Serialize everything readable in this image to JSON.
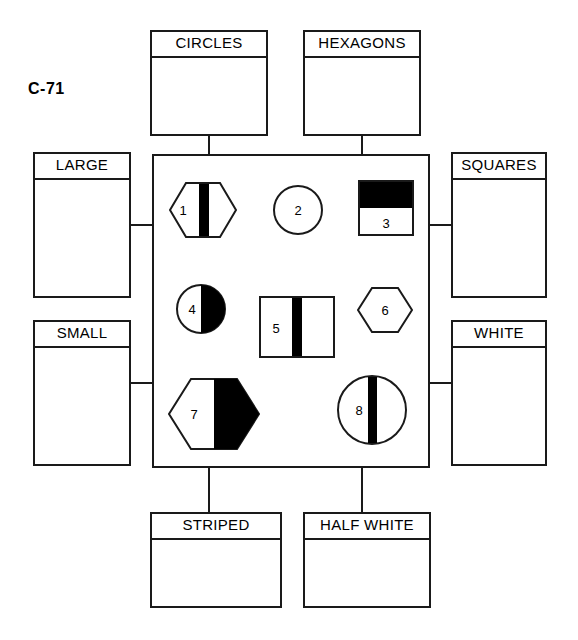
{
  "figure": {
    "title": "C-71",
    "type": "attribute-block classification grid"
  },
  "labels": {
    "top_left": "CIRCLES",
    "top_right": "HEXAGONS",
    "left_upper": "LARGE",
    "left_lower": "SMALL",
    "right_upper": "SQUARES",
    "right_lower": "WHITE",
    "bottom_left": "STRIPED",
    "bottom_right": "HALF WHITE"
  },
  "shapes": [
    {
      "number": "1",
      "form": "hexagon",
      "size": "large",
      "fill": "striped",
      "description": "large striped hexagon"
    },
    {
      "number": "2",
      "form": "circle",
      "size": "small",
      "fill": "white",
      "description": "small white circle"
    },
    {
      "number": "3",
      "form": "square",
      "size": "small",
      "fill": "half white",
      "description": "small half white square"
    },
    {
      "number": "4",
      "form": "circle",
      "size": "small",
      "fill": "half white",
      "description": "small half white circle"
    },
    {
      "number": "5",
      "form": "square",
      "size": "large",
      "fill": "striped",
      "description": "large striped square"
    },
    {
      "number": "6",
      "form": "hexagon",
      "size": "small",
      "fill": "white",
      "description": "small white hexagon"
    },
    {
      "number": "7",
      "form": "hexagon",
      "size": "large",
      "fill": "half white",
      "description": "large half white hexagon"
    },
    {
      "number": "8",
      "form": "circle",
      "size": "large",
      "fill": "striped",
      "description": "large striped circle"
    }
  ],
  "colors": {
    "line": "#1a1a1a",
    "fill_black": "#000000",
    "background": "#ffffff"
  }
}
